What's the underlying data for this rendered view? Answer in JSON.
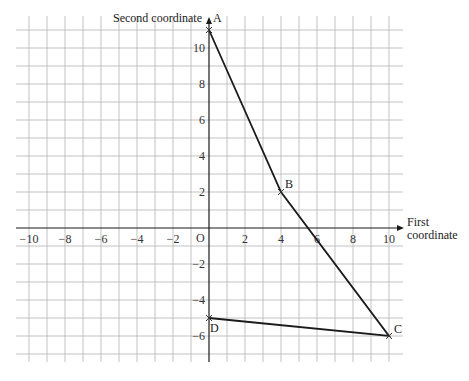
{
  "chart_data": {
    "type": "line",
    "title": "",
    "xlabel": "First coordinate",
    "xlabel_lines": [
      "First",
      "coordinate"
    ],
    "ylabel": "Second coordinate",
    "origin_label": "O",
    "xlim": [
      -10.7,
      10.7
    ],
    "ylim": [
      -7.5,
      11.8
    ],
    "grid": true,
    "x_ticks": [
      -10,
      -8,
      -6,
      -4,
      -2,
      2,
      4,
      6,
      8,
      10
    ],
    "x_tick_labels": [
      "−10",
      "−8",
      "−6",
      "−4",
      "−2",
      "2",
      "4",
      "6",
      "8",
      "10"
    ],
    "y_ticks": [
      10,
      8,
      6,
      4,
      2,
      -2,
      -4,
      -6
    ],
    "y_tick_labels": [
      "10",
      "8",
      "6",
      "4",
      "2",
      "−2",
      "−4",
      "−6"
    ],
    "points": [
      {
        "label": "A",
        "x": 0,
        "y": 11
      },
      {
        "label": "B",
        "x": 4,
        "y": 2
      },
      {
        "label": "C",
        "x": 10,
        "y": -6
      },
      {
        "label": "D",
        "x": 0,
        "y": -5
      }
    ],
    "series": [
      {
        "name": "path A-B-C-D",
        "x": [
          0,
          4,
          10,
          0
        ],
        "y": [
          11,
          2,
          -6,
          -5
        ]
      }
    ]
  }
}
